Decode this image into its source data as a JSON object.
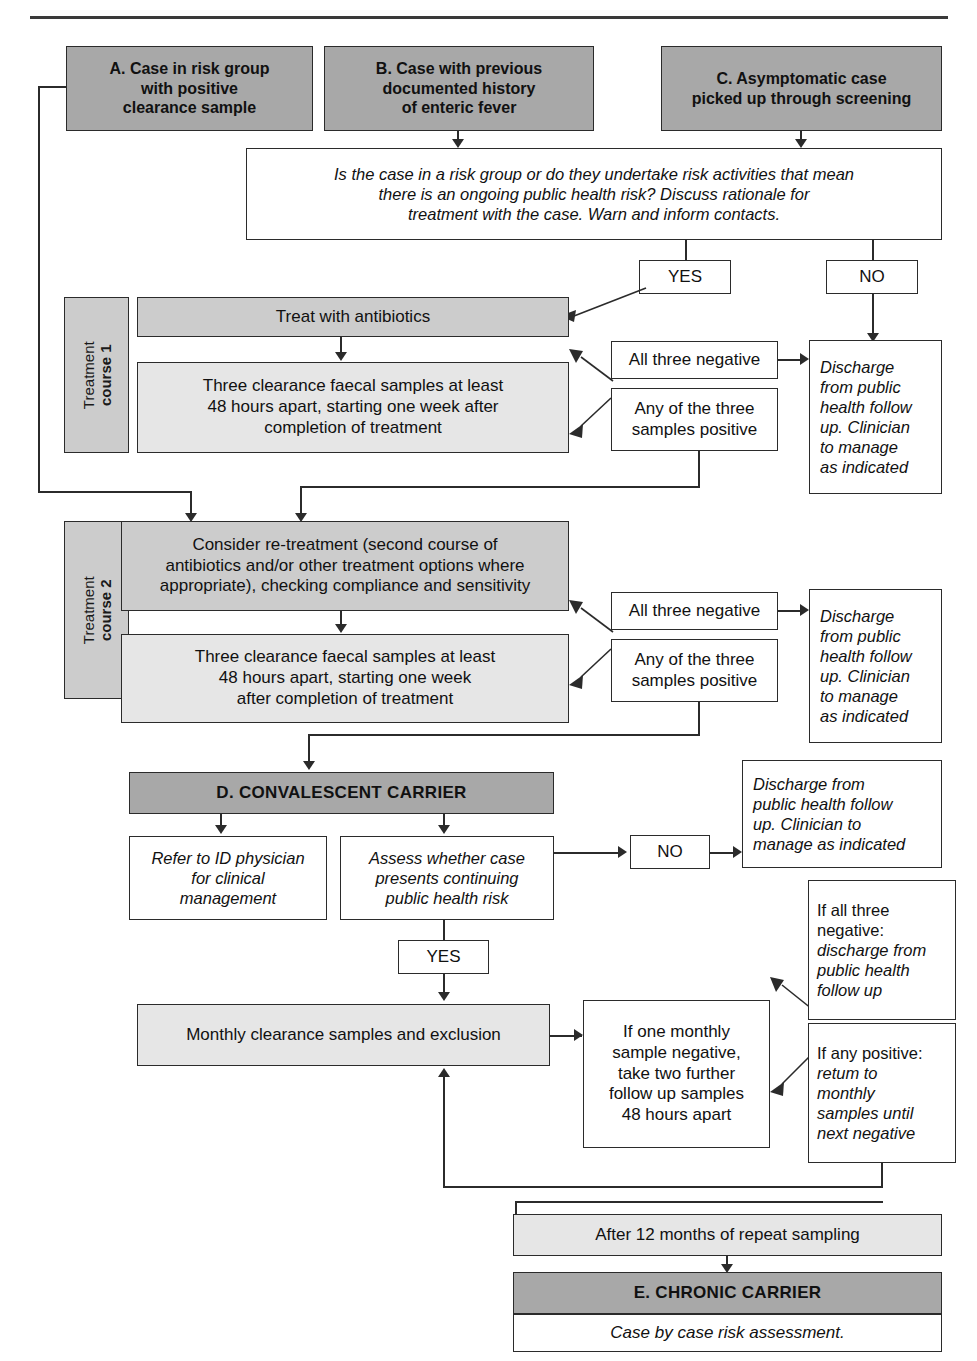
{
  "top_rule": {
    "name": "horizontal-divider"
  },
  "entry_nodes": [
    {
      "id": "A",
      "label": "A. Case in risk group with positive clearance sample",
      "lines": [
        "A. Case in risk group",
        "with positive",
        "clearance sample"
      ]
    },
    {
      "id": "B",
      "label": "B. Case with previous documented history of enteric fever",
      "lines": [
        "B. Case with previous",
        "documented history",
        "of enteric fever"
      ]
    },
    {
      "id": "C",
      "label": "C. Asymptomatic case picked up through screening",
      "lines": [
        "C. Asymptomatic case",
        "picked up through screening"
      ]
    }
  ],
  "question": {
    "lines": [
      "Is the case in a risk group or do they undertake risk activities that mean",
      "there is an ongoing public health risk? Discuss rationale for",
      "treatment with the case. Warn and inform contacts."
    ]
  },
  "decisions": {
    "yes_top": "YES",
    "no_top": "NO",
    "no_carrier": "NO",
    "yes_carrier": "YES"
  },
  "course1": {
    "side_label_line1": "Treatment",
    "side_label_line2": "course 1",
    "treat": "Treat with antibiotics",
    "samples_lines": [
      "Three clearance faecal samples at least",
      "48 hours apart, starting one week after",
      "completion of treatment"
    ],
    "all_negative_lines": [
      "All three negative"
    ],
    "any_positive_lines": [
      "Any of the three",
      "samples positive"
    ],
    "discharge_lines": [
      "Discharge",
      "from public",
      "health follow",
      "up. Clinician",
      "to manage",
      "as indicated"
    ]
  },
  "course2": {
    "side_label_line1": "Treatment",
    "side_label_line2": "course 2",
    "retreat_lines": [
      "Consider re-treatment (second course of",
      "antibiotics and/or other treatment options where",
      "appropriate), checking compliance and sensitivity"
    ],
    "samples_lines": [
      "Three clearance faecal samples at least",
      "48 hours apart, starting one week",
      "after completion of treatment"
    ],
    "all_negative_lines": [
      "All three negative"
    ],
    "any_positive_lines": [
      "Any of the three",
      "samples positive"
    ],
    "discharge_lines": [
      "Discharge",
      "from public",
      "health follow",
      "up. Clinician",
      "to manage",
      "as indicated"
    ]
  },
  "convalescent": {
    "title": "D. CONVALESCENT CARRIER",
    "refer_lines": [
      "Refer to ID physician",
      "for clinical",
      "management"
    ],
    "assess_lines": [
      "Assess whether case",
      "presents continuing",
      "public health risk"
    ],
    "discharge_lines": [
      "Discharge from",
      "public health follow",
      "up.  Clinician to",
      "manage as indicated"
    ]
  },
  "monthly": {
    "clearance": "Monthly clearance samples and exclusion",
    "if_one_negative_lines": [
      "If one monthly",
      "sample negative,",
      "take two further",
      "follow up samples",
      "48 hours apart"
    ],
    "if_all_negative_lines": [
      "If all three",
      "negative:",
      "discharge from",
      "public health",
      "follow up"
    ],
    "if_all_negative_plain": 2,
    "if_any_positive_lines": [
      "If any positive:",
      "retum to",
      "monthly",
      "samples until",
      "next negative"
    ],
    "if_any_positive_plain": 1
  },
  "chronic": {
    "after": "After 12 months of repeat sampling",
    "title": "E. CHRONIC CARRIER",
    "note": "Case by case risk assessment."
  },
  "colors": {
    "dark_fill": "#a8a8a8",
    "mid_fill": "#cccccc",
    "light_fill": "#e6e6e6",
    "white_fill": "#ffffff",
    "stroke": "#2b2b2b"
  }
}
